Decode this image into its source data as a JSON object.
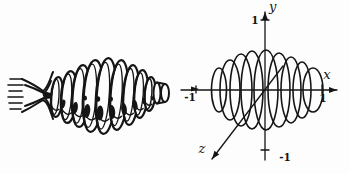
{
  "background": "#fdfdfd",
  "ink": "#151515",
  "left_solid": {
    "description": "pictorial sketch of ribbed solid of revolution",
    "hatch_lines": [
      [
        10,
        79,
        22,
        79
      ],
      [
        8,
        85,
        23,
        85
      ],
      [
        9,
        91,
        22,
        91
      ],
      [
        8,
        97,
        23,
        97
      ],
      [
        9,
        103,
        22,
        103
      ],
      [
        10,
        109,
        21,
        109
      ]
    ],
    "funnel": {
      "paths": [
        "M22,79 C33,84 39,88 43,91 C48,88 50,79 53,72",
        "M22,112 C33,107 39,102 43,100 C48,102 50,110 53,119",
        "M25,85 C34,88 40,91 44,93 C47,91 49,86 51,81",
        "M25,106 C34,103 40,100 44,98 C47,99 49,104 51,110"
      ],
      "shadow": "M43,91 C49,92 54,94 57,96 C54,98 49,99 45,99 C43,97 42,94 43,91 Z"
    },
    "ribs": [
      {
        "cx": 57,
        "cy": 97,
        "rx": 6,
        "ry": 20
      },
      {
        "cx": 69,
        "cy": 97,
        "rx": 8,
        "ry": 26
      },
      {
        "cx": 81,
        "cy": 96,
        "rx": 9,
        "ry": 31
      },
      {
        "cx": 93,
        "cy": 96,
        "rx": 10,
        "ry": 36
      },
      {
        "cx": 106,
        "cy": 96,
        "rx": 10,
        "ry": 38
      },
      {
        "cx": 119,
        "cy": 95,
        "rx": 9,
        "ry": 35
      },
      {
        "cx": 131,
        "cy": 95,
        "rx": 8,
        "ry": 30
      },
      {
        "cx": 141,
        "cy": 94,
        "rx": 7,
        "ry": 24
      },
      {
        "cx": 150,
        "cy": 94,
        "rx": 5.5,
        "ry": 17
      }
    ],
    "knob": {
      "back": {
        "cx": 157,
        "cy": 93,
        "rx": 3.5,
        "ry": 10.5
      },
      "front": {
        "cx": 165,
        "cy": 93,
        "rx": 4,
        "ry": 9
      },
      "top": [
        157,
        82.5,
        165,
        84
      ],
      "bottom": [
        157,
        103.5,
        165,
        102
      ]
    },
    "crevice_shadows": [
      {
        "x": 63,
        "y": 104,
        "rx": 2.2,
        "ry": 4.5,
        "rot": 14
      },
      {
        "x": 75,
        "y": 108,
        "rx": 2.8,
        "ry": 6,
        "rot": 10
      },
      {
        "x": 87,
        "y": 111,
        "rx": 3.2,
        "ry": 7,
        "rot": 6
      },
      {
        "x": 100,
        "y": 113,
        "rx": 3.4,
        "ry": 7.5,
        "rot": 2
      },
      {
        "x": 112,
        "y": 112,
        "rx": 3.2,
        "ry": 7,
        "rot": -4
      },
      {
        "x": 124,
        "y": 109,
        "rx": 2.8,
        "ry": 6,
        "rot": -8
      },
      {
        "x": 135,
        "y": 105,
        "rx": 2.4,
        "ry": 5,
        "rot": -12
      },
      {
        "x": 144,
        "y": 101,
        "rx": 1.8,
        "ry": 3.6,
        "rot": -14
      },
      {
        "x": 152,
        "y": 98,
        "rx": 1.2,
        "ry": 2.5,
        "rot": -14
      },
      {
        "x": 85,
        "y": 98,
        "rx": 2,
        "ry": 2.6,
        "rot": 0
      },
      {
        "x": 98,
        "y": 99,
        "rx": 2.2,
        "ry": 2.8,
        "rot": 0
      },
      {
        "x": 111,
        "y": 99,
        "rx": 2,
        "ry": 2.6,
        "rot": 0
      }
    ]
  },
  "right_plot": {
    "description": "cross sections of the solid on coordinate axes",
    "origin": {
      "x": 265,
      "y": 90
    },
    "x_axis": {
      "line": [
        181,
        90,
        337,
        90
      ],
      "label": "x",
      "label_pos": [
        327,
        79
      ],
      "mid_arrow": "191,86.6 191,91.4 199,89",
      "ticks": [
        {
          "x": 196,
          "y1": 86,
          "y2": 93,
          "label": "-1",
          "lx": 190,
          "ly": 101
        },
        {
          "x": 322,
          "y1": 85,
          "y2": 94,
          "label": "1",
          "lx": 323,
          "ly": 102
        }
      ]
    },
    "y_axis": {
      "line": [
        265,
        160,
        265,
        12
      ],
      "label": "y",
      "label_pos": [
        269,
        11
      ],
      "ticks": [
        {
          "x1": 261,
          "x2": 269,
          "y": 20,
          "label": "1",
          "lx": 255,
          "ly": 24
        },
        {
          "x1": 261,
          "x2": 269,
          "y": 150,
          "label": "-1",
          "lx": 285,
          "ly": 161
        }
      ]
    },
    "z_axis": {
      "line": [
        283,
        66,
        212,
        159
      ],
      "label": "z",
      "label_pos": [
        202,
        153
      ]
    },
    "cross_sections": [
      {
        "cx": 219,
        "cy": 90,
        "rx": 7.5,
        "ry": 22
      },
      {
        "cx": 230,
        "cy": 90,
        "rx": 10,
        "ry": 30
      },
      {
        "cx": 241,
        "cy": 90,
        "rx": 11,
        "ry": 36
      },
      {
        "cx": 252,
        "cy": 90,
        "rx": 11,
        "ry": 39
      },
      {
        "cx": 266,
        "cy": 90,
        "rx": 12,
        "ry": 40
      },
      {
        "cx": 279,
        "cy": 90,
        "rx": 11,
        "ry": 37
      },
      {
        "cx": 291,
        "cy": 90,
        "rx": 10,
        "ry": 33
      },
      {
        "cx": 302,
        "cy": 90,
        "rx": 9,
        "ry": 28
      },
      {
        "cx": 313,
        "cy": 90,
        "rx": 10,
        "ry": 22
      }
    ],
    "units": {
      "x_tick_values": [
        -1,
        1
      ],
      "y_tick_values": [
        1,
        -1
      ],
      "section_centers_units": [
        -0.77,
        -0.58,
        -0.4,
        -0.22,
        0.02,
        0.23,
        0.43,
        0.62,
        0.8
      ],
      "section_radii_units": [
        0.37,
        0.5,
        0.6,
        0.65,
        0.67,
        0.62,
        0.55,
        0.47,
        0.37
      ]
    }
  }
}
